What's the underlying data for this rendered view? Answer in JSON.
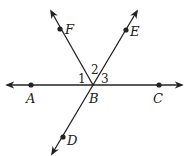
{
  "diagram": {
    "title": "",
    "points": [
      {
        "id": "A",
        "label": "A",
        "x": 31,
        "y": 85
      },
      {
        "id": "B",
        "label": "B",
        "x": 93,
        "y": 85
      },
      {
        "id": "C",
        "label": "C",
        "x": 159,
        "y": 85
      },
      {
        "id": "D",
        "label": "D",
        "x": 64,
        "y": 137
      },
      {
        "id": "E",
        "label": "E",
        "x": 126,
        "y": 29
      },
      {
        "id": "F",
        "label": "F",
        "x": 60,
        "y": 29
      }
    ],
    "lines": [
      {
        "name": "line-AC",
        "from": "A",
        "to": "C"
      },
      {
        "name": "ray-BF",
        "from": "B",
        "to": "F"
      },
      {
        "name": "line-DE",
        "from": "D",
        "to": "E"
      }
    ],
    "angles": [
      {
        "label": "1",
        "between": "BA-BF"
      },
      {
        "label": "2",
        "between": "BF-BE"
      },
      {
        "label": "3",
        "between": "BE-BC"
      }
    ],
    "colors": {
      "stroke": "#222222",
      "background": "#ffffff"
    }
  }
}
